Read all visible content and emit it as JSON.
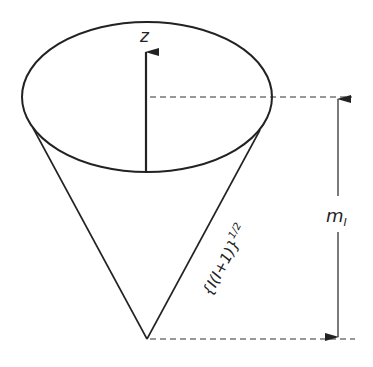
{
  "diagram": {
    "axis_label": "z",
    "slant_label": "{I(I+1)}",
    "slant_exponent": "1/2",
    "projection_label_main": "m",
    "projection_label_sub": "I",
    "colors": {
      "line": "#222222",
      "background": "#ffffff"
    }
  }
}
